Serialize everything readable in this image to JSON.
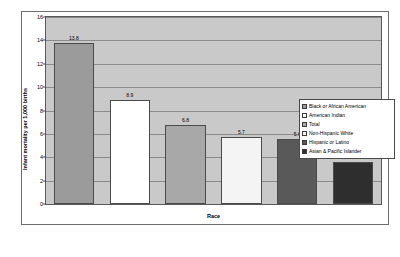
{
  "chart_data": {
    "type": "bar",
    "title": "",
    "xlabel": "Race",
    "ylabel": "Infant mortality per 1,000 births",
    "categories": [
      "Black or African American",
      "American Indian",
      "Total",
      "Non-Hispanic White",
      "Hispanic or Latino",
      "Asian & Pacific Islander"
    ],
    "values": [
      13.8,
      8.9,
      6.8,
      5.7,
      5.6,
      3.6
    ],
    "data_labels": [
      "13.8",
      "8.9",
      "6.8",
      "5.7",
      "5.6",
      "3.6"
    ],
    "ylim": [
      0,
      16
    ],
    "yticks": [
      0,
      2,
      4,
      6,
      8,
      10,
      12,
      14,
      16
    ],
    "ytick_labels": [
      "0",
      "2",
      "4",
      "6",
      "8",
      "10",
      "12",
      "14",
      "16"
    ],
    "grid": true,
    "legend_position": "right",
    "bar_colors": [
      "#9b9b9b",
      "#ffffff",
      "#a8a8a8",
      "#f4f4f4",
      "#595959",
      "#2e2e2e"
    ],
    "plot_background": "#c9c9c9",
    "legend": [
      {
        "label": "Black or African American",
        "color": "#9b9b9b"
      },
      {
        "label": "American Indian",
        "color": "#ffffff"
      },
      {
        "label": "Total",
        "color": "#a8a8a8"
      },
      {
        "label": "Non-Hispanic White",
        "color": "#f4f4f4"
      },
      {
        "label": "Hispanic or Latino",
        "color": "#595959"
      },
      {
        "label": "Asian & Pacific Islander",
        "color": "#2e2e2e"
      }
    ]
  }
}
